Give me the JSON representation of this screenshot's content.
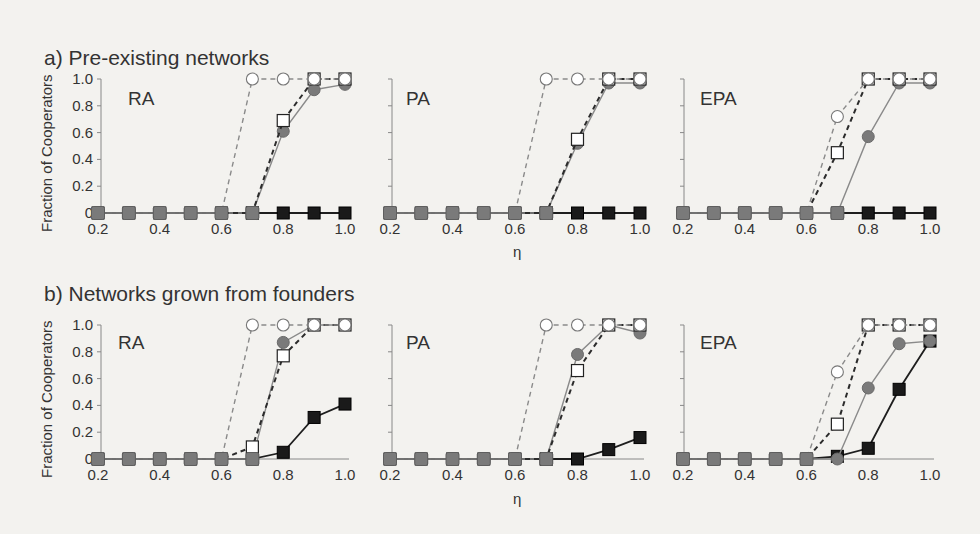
{
  "figure": {
    "section_a_title": "a) Pre-existing networks",
    "section_b_title": "b) Networks grown from founders",
    "ylabel": "Fraction of Cooperators",
    "xlabel": "η"
  },
  "chart_data": [
    {
      "type": "line",
      "section": "a) Pre-existing networks",
      "panel": "RA",
      "x": [
        0.2,
        0.3,
        0.4,
        0.5,
        0.6,
        0.7,
        0.8,
        0.9,
        1.0
      ],
      "series": [
        {
          "name": "open circle dashed",
          "marker": "open-circle",
          "line": "dashed-light",
          "values": [
            0,
            0,
            0,
            0,
            0,
            1.0,
            1.0,
            1.0,
            1.0
          ]
        },
        {
          "name": "open square dashed",
          "marker": "open-square",
          "line": "dashed-dark",
          "values": [
            0,
            0,
            0,
            0,
            0,
            0,
            0.69,
            1.0,
            1.0
          ]
        },
        {
          "name": "gray circle solid",
          "marker": "gray-circle",
          "line": "solid-light",
          "values": [
            0,
            0,
            0,
            0,
            0,
            0,
            0.61,
            0.92,
            0.96
          ]
        },
        {
          "name": "black square solid",
          "marker": "black-square",
          "line": "solid-dark",
          "values": [
            0,
            0,
            0,
            0,
            0,
            0,
            0,
            0,
            0
          ]
        }
      ],
      "xticks": [
        "0.2",
        "0.4",
        "0.6",
        "0.8",
        "1.0"
      ],
      "yticks": [
        "0",
        "0.2",
        "0.4",
        "0.6",
        "0.8",
        "1.0"
      ],
      "xlabel": "",
      "ylabel": "Fraction of Cooperators",
      "ylim": [
        0,
        1.0
      ],
      "grid": false
    },
    {
      "type": "line",
      "section": "a) Pre-existing networks",
      "panel": "PA",
      "x": [
        0.2,
        0.3,
        0.4,
        0.5,
        0.6,
        0.7,
        0.8,
        0.9,
        1.0
      ],
      "series": [
        {
          "name": "open circle dashed",
          "marker": "open-circle",
          "line": "dashed-light",
          "values": [
            0,
            0,
            0,
            0,
            0,
            1.0,
            1.0,
            1.0,
            1.0
          ]
        },
        {
          "name": "open square dashed",
          "marker": "open-square",
          "line": "dashed-dark",
          "values": [
            0,
            0,
            0,
            0,
            0,
            0,
            0.55,
            1.0,
            1.0
          ]
        },
        {
          "name": "gray circle solid",
          "marker": "gray-circle",
          "line": "solid-light",
          "values": [
            0,
            0,
            0,
            0,
            0,
            0,
            0.52,
            0.97,
            0.97
          ]
        },
        {
          "name": "black square solid",
          "marker": "black-square",
          "line": "solid-dark",
          "values": [
            0,
            0,
            0,
            0,
            0,
            0,
            0,
            0,
            0
          ]
        }
      ],
      "xticks": [
        "0.2",
        "0.4",
        "0.6",
        "0.8",
        "1.0"
      ],
      "xlabel": "η",
      "ylim": [
        0,
        1.0
      ],
      "grid": false
    },
    {
      "type": "line",
      "section": "a) Pre-existing networks",
      "panel": "EPA",
      "x": [
        0.2,
        0.3,
        0.4,
        0.5,
        0.6,
        0.7,
        0.8,
        0.9,
        1.0
      ],
      "series": [
        {
          "name": "open circle dashed",
          "marker": "open-circle",
          "line": "dashed-light",
          "values": [
            0,
            0,
            0,
            0,
            0,
            0.72,
            1.0,
            1.0,
            1.0
          ]
        },
        {
          "name": "open square dashed",
          "marker": "open-square",
          "line": "dashed-dark",
          "values": [
            0,
            0,
            0,
            0,
            0,
            0.45,
            1.0,
            1.0,
            1.0
          ]
        },
        {
          "name": "gray circle solid",
          "marker": "gray-circle",
          "line": "solid-light",
          "values": [
            0,
            0,
            0,
            0,
            0,
            0,
            0.57,
            0.97,
            0.97
          ]
        },
        {
          "name": "black square solid",
          "marker": "black-square",
          "line": "solid-dark",
          "values": [
            0,
            0,
            0,
            0,
            0,
            0,
            0,
            0,
            0
          ]
        }
      ],
      "xticks": [
        "0.2",
        "0.4",
        "0.6",
        "0.8",
        "1.0"
      ],
      "xlabel": "",
      "ylim": [
        0,
        1.0
      ],
      "grid": false
    },
    {
      "type": "line",
      "section": "b) Networks grown from founders",
      "panel": "RA",
      "x": [
        0.2,
        0.3,
        0.4,
        0.5,
        0.6,
        0.7,
        0.8,
        0.9,
        1.0
      ],
      "series": [
        {
          "name": "open circle dashed",
          "marker": "open-circle",
          "line": "dashed-light",
          "values": [
            0,
            0,
            0,
            0,
            0,
            1.0,
            1.0,
            1.0,
            1.0
          ]
        },
        {
          "name": "open square dashed",
          "marker": "open-square",
          "line": "dashed-dark",
          "values": [
            0,
            0,
            0,
            0,
            0,
            0.09,
            0.77,
            1.0,
            1.0
          ]
        },
        {
          "name": "gray circle solid",
          "marker": "gray-circle",
          "line": "solid-light",
          "values": [
            0,
            0,
            0,
            0,
            0,
            0,
            0.87,
            1.0,
            1.0
          ]
        },
        {
          "name": "black square solid",
          "marker": "black-square",
          "line": "solid-dark",
          "values": [
            0,
            0,
            0,
            0,
            0,
            0,
            0.05,
            0.31,
            0.41
          ]
        }
      ],
      "xticks": [
        "0.2",
        "0.4",
        "0.6",
        "0.8",
        "1.0"
      ],
      "yticks": [
        "0",
        "0.2",
        "0.4",
        "0.6",
        "0.8",
        "1.0"
      ],
      "xlabel": "",
      "ylabel": "Fraction of Cooperators",
      "ylim": [
        0,
        1.0
      ],
      "grid": false
    },
    {
      "type": "line",
      "section": "b) Networks grown from founders",
      "panel": "PA",
      "x": [
        0.2,
        0.3,
        0.4,
        0.5,
        0.6,
        0.7,
        0.8,
        0.9,
        1.0
      ],
      "series": [
        {
          "name": "open circle dashed",
          "marker": "open-circle",
          "line": "dashed-light",
          "values": [
            0,
            0,
            0,
            0,
            0,
            1.0,
            1.0,
            1.0,
            1.0
          ]
        },
        {
          "name": "open square dashed",
          "marker": "open-square",
          "line": "dashed-dark",
          "values": [
            0,
            0,
            0,
            0,
            0,
            0,
            0.66,
            1.0,
            1.0
          ]
        },
        {
          "name": "gray circle solid",
          "marker": "gray-circle",
          "line": "solid-light",
          "values": [
            0,
            0,
            0,
            0,
            0,
            0,
            0.78,
            1.0,
            0.94
          ]
        },
        {
          "name": "black square solid",
          "marker": "black-square",
          "line": "solid-dark",
          "values": [
            0,
            0,
            0,
            0,
            0,
            0,
            0,
            0.07,
            0.16
          ]
        }
      ],
      "xticks": [
        "0.2",
        "0.4",
        "0.6",
        "0.8",
        "1.0"
      ],
      "xlabel": "η",
      "ylim": [
        0,
        1.0
      ],
      "grid": false
    },
    {
      "type": "line",
      "section": "b) Networks grown from founders",
      "panel": "EPA",
      "x": [
        0.2,
        0.3,
        0.4,
        0.5,
        0.6,
        0.7,
        0.8,
        0.9,
        1.0
      ],
      "series": [
        {
          "name": "open circle dashed",
          "marker": "open-circle",
          "line": "dashed-light",
          "values": [
            0,
            0,
            0,
            0,
            0,
            0.65,
            1.0,
            1.0,
            1.0
          ]
        },
        {
          "name": "open square dashed",
          "marker": "open-square",
          "line": "dashed-dark",
          "values": [
            0,
            0,
            0,
            0,
            0,
            0.26,
            1.0,
            1.0,
            1.0
          ]
        },
        {
          "name": "gray circle solid",
          "marker": "gray-circle",
          "line": "solid-light",
          "values": [
            0,
            0,
            0,
            0,
            0,
            0,
            0.53,
            0.86,
            0.88
          ]
        },
        {
          "name": "black square solid",
          "marker": "black-square",
          "line": "solid-dark",
          "values": [
            0,
            0,
            0,
            0,
            0,
            0.02,
            0.08,
            0.52,
            0.88
          ]
        }
      ],
      "xticks": [
        "0.2",
        "0.4",
        "0.6",
        "0.8",
        "1.0"
      ],
      "xlabel": "",
      "ylim": [
        0,
        1.0
      ],
      "grid": false
    }
  ],
  "colors": {
    "axis": "#888888",
    "dashed_light": "#8a8a8a",
    "dashed_dark": "#2b2b2b",
    "solid_light": "#8a8a8a",
    "solid_dark": "#1e1e1e",
    "gray_fill": "#7a7a7a",
    "black_fill": "#1a1a1a",
    "open_fill": "#ffffff"
  }
}
